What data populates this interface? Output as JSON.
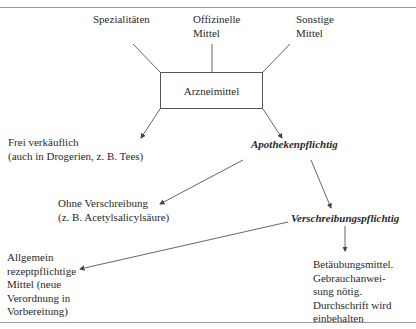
{
  "diagram": {
    "center": {
      "label": "Arzneimittel"
    },
    "sources": [
      {
        "label": "Spezialitäten"
      },
      {
        "label_line1": "Offizinelle",
        "label_line2": "Mittel"
      },
      {
        "label_line1": "Sonstige",
        "label_line2": "Mittel"
      }
    ],
    "free": {
      "line1": "Frei verkäuflich",
      "line2": "(auch in Drogerien, z. B. Tees)"
    },
    "pharmacy": {
      "label": "Apothekenpflichtig"
    },
    "otc": {
      "line1": "Ohne Verschreibung",
      "line2": "(z. B. Acetylsalicylsäure)"
    },
    "prescription": {
      "label": "Verschreibungspflichtig"
    },
    "general_rx": {
      "lines": [
        "Allgemein",
        "rezeptpflichtige",
        "Mittel (neue",
        "Verordnung in",
        "Vorbereitung)"
      ]
    },
    "narcotics": {
      "lines": [
        "Betäubungsmittel.",
        "Gebrauchanwei-",
        "sung nötig.",
        "Durchschrift wird",
        "einbehalten"
      ]
    }
  }
}
